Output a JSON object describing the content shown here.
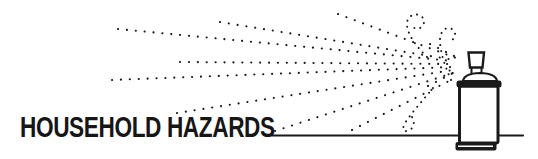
{
  "title": "HOUSEHOLD HAZARDS",
  "illustration": {
    "description": "aerosol-spray-can-with-dotted-spray",
    "ink_color": "#1a1a1a",
    "background_color": "#ffffff",
    "spray_origin": {
      "x": 459,
      "y": 64
    },
    "rays": [
      {
        "x1": 118,
        "y1": 29,
        "x2": 453,
        "y2": 61
      },
      {
        "x1": 220,
        "y1": 22,
        "x2": 455,
        "y2": 60
      },
      {
        "x1": 338,
        "y1": 14,
        "x2": 456,
        "y2": 58
      },
      {
        "x1": 180,
        "y1": 62,
        "x2": 452,
        "y2": 64
      },
      {
        "x1": 112,
        "y1": 80,
        "x2": 452,
        "y2": 67
      },
      {
        "x1": 177,
        "y1": 113,
        "x2": 453,
        "y2": 70
      },
      {
        "x1": 275,
        "y1": 131,
        "x2": 453,
        "y2": 73
      },
      {
        "x1": 352,
        "y1": 130,
        "x2": 455,
        "y2": 78
      },
      {
        "x1": 430,
        "y1": 44,
        "x2": 456,
        "y2": 57
      },
      {
        "x1": 428,
        "y1": 86,
        "x2": 455,
        "y2": 72
      }
    ],
    "swirls": [
      "M 427 57 C 417 47 409 37 407 26 C 406 18 412 13 419 15 C 425 17 426 25 420 28 C 416 30 412 28 413 23",
      "M 451 80 C 445 66 440 52 440 40 C 440 31 446 26 452 29 C 457 32 456 40 449 41",
      "M 433 88 C 424 99 414 110 407 120 C 402 127 402 132 407 131 C 413 130 416 123 412 117"
    ],
    "ground_line": {
      "x1": 272,
      "y1": 135.5,
      "x2": 523,
      "y2": 135.5
    },
    "can": {
      "body": {
        "x": 459.5,
        "y": 86,
        "w": 38.5,
        "h": 57,
        "rx": 2
      },
      "top_rim": {
        "x": 456.5,
        "y": 80.5,
        "w": 45,
        "h": 7,
        "rx": 2.5
      },
      "dome_path": "M 463 81 Q 464 73.5 480 73 Q 496 73.5 497 81 Z",
      "stem": {
        "x": 471.5,
        "y": 67,
        "w": 10,
        "h": 7
      },
      "cap_path": "M 468.5 52.5 L 484 52.5 L 482.5 67.5 L 470 67.5 Z",
      "bottom_rim": {
        "x": 455.5,
        "y": 142,
        "w": 41,
        "h": 8.5,
        "rx": 2
      },
      "bottom_rim_highlight": {
        "x1": 458,
        "y1": 146.2,
        "x2": 493,
        "y2": 146.2
      }
    }
  }
}
